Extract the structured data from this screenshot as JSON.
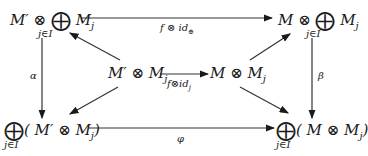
{
  "diagram": {
    "type": "commutative-diagram",
    "nodes": {
      "top_left": {
        "text": "M′ ⊗ ⨁ M_j",
        "main": "M′ ⊗ ",
        "bigop": "⨁",
        "tail": " M",
        "sub": "j",
        "under": "j∈I"
      },
      "top_right": {
        "text": "M ⊗ ⨁ M_j",
        "main": "M ⊗ ",
        "bigop": "⨁",
        "tail": " M",
        "sub": "j",
        "under": "j∈I"
      },
      "center_left": {
        "text": "M′ ⊗ M_j",
        "main": "M′ ⊗ M",
        "sub": "j"
      },
      "center_right": {
        "text": "M ⊗ M_j",
        "main": "M ⊗ M",
        "sub": "j"
      },
      "bottom_left": {
        "text": "⨁(M′ ⊗ M_j)",
        "bigop": "⨁",
        "main": "( M′ ⊗ M",
        "sub": "j",
        "close": ")",
        "under": "j∈I"
      },
      "bottom_right": {
        "text": "⨁(M ⊗ M_j)",
        "bigop": "⨁",
        "main": "( M ⊗ M",
        "sub": "j",
        "close": ")",
        "under": "j∈I"
      }
    },
    "arrows": [
      {
        "from": "top_left",
        "to": "top_right",
        "label": "f ⊗ id⊕"
      },
      {
        "from": "center_left",
        "to": "center_right",
        "label": "f⊗id_j"
      },
      {
        "from": "top_left",
        "to": "bottom_left",
        "label": "α"
      },
      {
        "from": "top_right",
        "to": "bottom_right",
        "label": "β"
      },
      {
        "from": "bottom_left",
        "to": "bottom_right",
        "label": "φ"
      },
      {
        "from": "center_left",
        "to": "top_left",
        "label": ""
      },
      {
        "from": "center_right",
        "to": "top_right",
        "label": ""
      },
      {
        "from": "center_left",
        "to": "bottom_left",
        "label": ""
      },
      {
        "from": "center_right",
        "to": "bottom_right",
        "label": ""
      }
    ],
    "labels": {
      "top": "f ⊗ id",
      "top_sub": "⊕",
      "middle": "f⊗id",
      "middle_sub": "j",
      "left": "α",
      "right": "β",
      "bottom": "φ"
    }
  }
}
